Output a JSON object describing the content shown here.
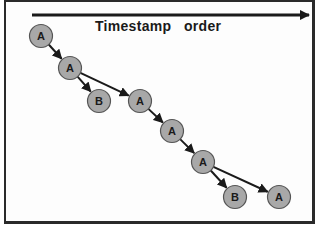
{
  "diagram": {
    "title": "Timestamp   order",
    "colors": {
      "node_fill": "#a8a8a8",
      "node_stroke": "#555555",
      "arrow": "#1a1a1a",
      "frame": "#2a2a2a"
    },
    "nodes": [
      {
        "id": "n1",
        "label": "A",
        "x": 41,
        "y": 36
      },
      {
        "id": "n2",
        "label": "A",
        "x": 70,
        "y": 68
      },
      {
        "id": "n3",
        "label": "B",
        "x": 99,
        "y": 101
      },
      {
        "id": "n4",
        "label": "A",
        "x": 140,
        "y": 101
      },
      {
        "id": "n5",
        "label": "A",
        "x": 172,
        "y": 131
      },
      {
        "id": "n6",
        "label": "A",
        "x": 203,
        "y": 162
      },
      {
        "id": "n7",
        "label": "B",
        "x": 235,
        "y": 197
      },
      {
        "id": "n8",
        "label": "A",
        "x": 279,
        "y": 197
      }
    ],
    "edges": [
      {
        "from": "n1",
        "to": "n2"
      },
      {
        "from": "n2",
        "to": "n3"
      },
      {
        "from": "n2",
        "to": "n4"
      },
      {
        "from": "n4",
        "to": "n5"
      },
      {
        "from": "n5",
        "to": "n6"
      },
      {
        "from": "n6",
        "to": "n7"
      },
      {
        "from": "n6",
        "to": "n8"
      }
    ]
  }
}
